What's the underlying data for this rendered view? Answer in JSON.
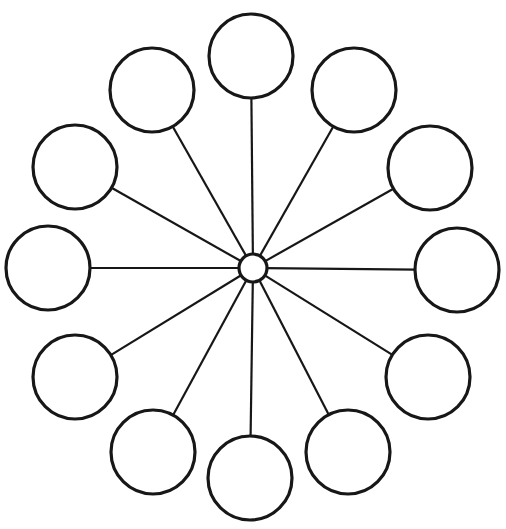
{
  "document": {
    "title": "Radial Bubble Diagram",
    "type": "blank-brainstorm-web-template",
    "background_color": "#ffffff",
    "stroke_color": "#171717",
    "canvas": {
      "width": 506,
      "height": 529
    }
  },
  "chart_data": {
    "type": "diagram",
    "subtype": "radial-spoke-web",
    "title": "",
    "xlabel": "",
    "ylabel": "",
    "grid": false,
    "legend": false,
    "node_count": 12,
    "spoke_count": 12,
    "hub": {
      "label": "",
      "cx": 253,
      "cy": 268,
      "r": 14,
      "stroke_width": 3.2
    },
    "node_radius": 42,
    "spoke_stroke_width": 2.2,
    "node_stroke_width": 3.2,
    "nodes": [
      {
        "id": "node-1",
        "label": "",
        "angle_deg": 270,
        "cx": 251,
        "cy": 56
      },
      {
        "id": "node-2",
        "label": "",
        "angle_deg": 300,
        "cx": 354,
        "cy": 90
      },
      {
        "id": "node-3",
        "label": "",
        "angle_deg": 330,
        "cx": 430,
        "cy": 168
      },
      {
        "id": "node-4",
        "label": "",
        "angle_deg": 0,
        "cx": 457,
        "cy": 270
      },
      {
        "id": "node-5",
        "label": "",
        "angle_deg": 30,
        "cx": 428,
        "cy": 377
      },
      {
        "id": "node-6",
        "label": "",
        "angle_deg": 60,
        "cx": 348,
        "cy": 452
      },
      {
        "id": "node-7",
        "label": "",
        "angle_deg": 90,
        "cx": 250,
        "cy": 478
      },
      {
        "id": "node-8",
        "label": "",
        "angle_deg": 120,
        "cx": 153,
        "cy": 452
      },
      {
        "id": "node-9",
        "label": "",
        "angle_deg": 150,
        "cx": 75,
        "cy": 377
      },
      {
        "id": "node-10",
        "label": "",
        "angle_deg": 180,
        "cx": 48,
        "cy": 268
      },
      {
        "id": "node-11",
        "label": "",
        "angle_deg": 210,
        "cx": 75,
        "cy": 167
      },
      {
        "id": "node-12",
        "label": "",
        "angle_deg": 240,
        "cx": 152,
        "cy": 90
      }
    ]
  }
}
